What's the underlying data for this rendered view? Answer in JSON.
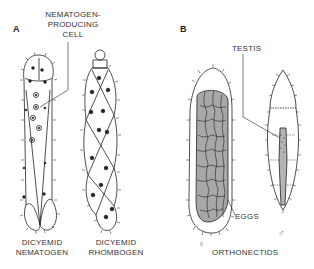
{
  "figure": {
    "panels": [
      {
        "id": "A",
        "label": "A"
      },
      {
        "id": "B",
        "label": "B"
      }
    ],
    "callouts": {
      "nematogen_cell": [
        "NEMATOGEN-",
        "PRODUCING",
        "CELL"
      ],
      "testis": "TESTIS",
      "eggs": "EGGS"
    },
    "captions": {
      "nematogen": [
        "DICYEMID",
        "NEMATOGEN"
      ],
      "rhombogen": [
        "DICYEMID",
        "RHOMBOGEN"
      ],
      "orthonectids": "ORTHONECTIDS"
    },
    "symbols": {
      "female": "♀",
      "male": "♂"
    },
    "colors": {
      "ink": "#222222",
      "egg_fill": "#a8a8a8",
      "background": "#ffffff"
    }
  }
}
